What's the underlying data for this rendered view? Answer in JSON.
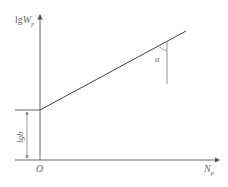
{
  "diagram": {
    "type": "log-linear relationship sketch",
    "y_axis": {
      "label_prefix": "lg",
      "label_var": "W",
      "label_sub": "p"
    },
    "x_axis": {
      "label_var": "N",
      "label_sub": "p"
    },
    "origin_label": "O",
    "intercept_label": "lgb",
    "angle_label": "a",
    "colors": {
      "line": "#4a4a4a",
      "axis": "#555555",
      "text": "#6a6a6a"
    }
  }
}
